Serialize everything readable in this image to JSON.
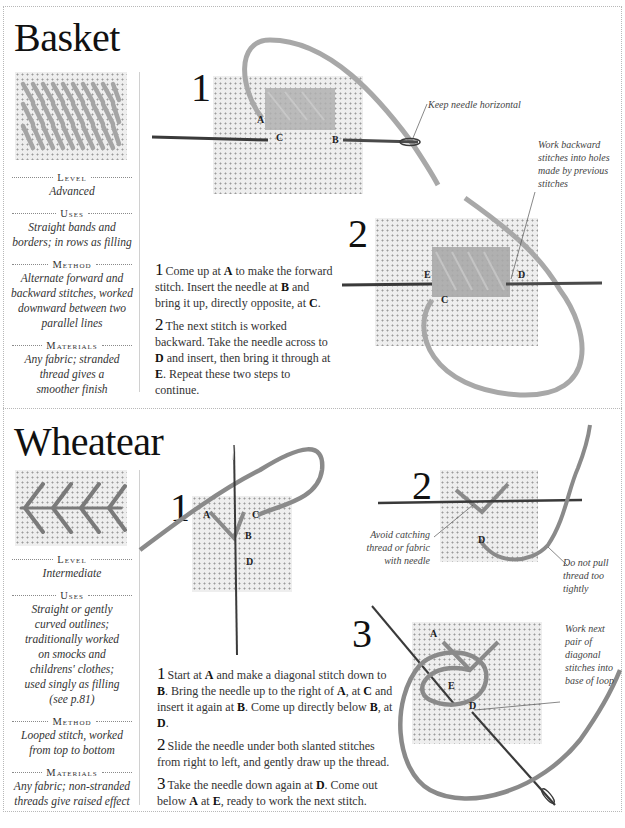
{
  "colors": {
    "basket_thread": "#a8a8a8",
    "wheatear_thread": "#8a8a8a",
    "needle": "#4a4a4a",
    "canvas": "#eeeeee",
    "border_dots": "#b8b8b8"
  },
  "basket": {
    "title": "Basket",
    "sidebar": {
      "level_heading": "Level",
      "level_value": "Advanced",
      "uses_heading": "Uses",
      "uses_value": "Straight bands and borders; in rows as filling",
      "method_heading": "Method",
      "method_value": "Alternate forward and backward stitches, worked downward between two parallel lines",
      "materials_heading": "Materials",
      "materials_value": "Any fabric; stranded thread gives a smoother finish"
    },
    "steps": [
      {
        "number": "1",
        "parts": [
          "Come up at ",
          "A",
          " to make the forward stitch. Insert the needle at ",
          "B",
          " and bring it up, directly opposite, at ",
          "C",
          "."
        ]
      },
      {
        "number": "2",
        "parts": [
          "The next stitch is worked backward. Take the needle across to ",
          "D",
          " and insert, then bring it through at ",
          "E",
          ". Repeat these two steps to continue."
        ]
      }
    ],
    "diagram1": {
      "step_label": "1",
      "points": {
        "A": "A",
        "B": "B",
        "C": "C"
      },
      "callout": "Keep needle horizontal"
    },
    "diagram2": {
      "step_label": "2",
      "points": {
        "C": "C",
        "D": "D",
        "E": "E"
      },
      "callout": "Work backward stitches into holes made by previous stitches"
    }
  },
  "wheatear": {
    "title": "Wheatear",
    "sidebar": {
      "level_heading": "Level",
      "level_value": "Intermediate",
      "uses_heading": "Uses",
      "uses_value": "Straight or gently curved outlines; traditionally worked on smocks and childrens' clothes; used singly as filling (see p.81)",
      "method_heading": "Method",
      "method_value": "Looped stitch, worked from top to bottom",
      "materials_heading": "Materials",
      "materials_value": "Any fabric; non-stranded threads give raised effect"
    },
    "steps": [
      {
        "number": "1",
        "parts": [
          "Start at ",
          "A",
          " and make a diagonal stitch down to ",
          "B",
          ". Bring the needle up to the right of ",
          "A",
          ", at ",
          "C",
          " and insert it again at ",
          "B",
          ". Come up directly below ",
          "B",
          ", at ",
          "D",
          "."
        ]
      },
      {
        "number": "2",
        "parts": [
          "Slide the needle under both slanted stitches from right to left, and gently draw up the thread."
        ]
      },
      {
        "number": "3",
        "parts": [
          "Take the needle down again at ",
          "D",
          ". Come out below ",
          "A",
          " at ",
          "E",
          ", ready to work the next stitch."
        ]
      }
    ],
    "diagram1": {
      "step_label": "1",
      "points": {
        "A": "A",
        "B": "B",
        "C": "C",
        "D": "D"
      }
    },
    "diagram2": {
      "step_label": "2",
      "points": {
        "D": "D"
      },
      "callout_left": "Avoid catching thread or fabric with needle",
      "callout_right": "Do not pull thread too tightly"
    },
    "diagram3": {
      "step_label": "3",
      "points": {
        "A": "A",
        "E": "E",
        "D": "D"
      },
      "callout": "Work next pair of diagonal stitches into base of loop"
    }
  }
}
